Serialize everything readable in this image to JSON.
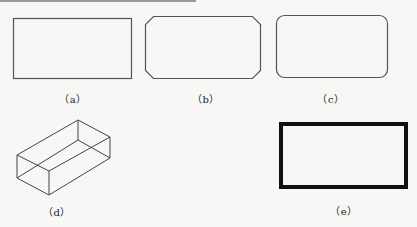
{
  "figure": {
    "panels": [
      {
        "id": "a",
        "label": "（a）",
        "shape": "rectangle",
        "description": "plain rectangle, thin border"
      },
      {
        "id": "b",
        "label": "（b）",
        "shape": "chamfered-rectangle",
        "description": "rectangle with chamfered (beveled) corners"
      },
      {
        "id": "c",
        "label": "（c）",
        "shape": "rounded-rectangle",
        "description": "rectangle with filleted (rounded) corners"
      },
      {
        "id": "d",
        "label": "（d）",
        "shape": "3d-box",
        "description": "isometric wireframe box (3D rectangle)"
      },
      {
        "id": "e",
        "label": "（e）",
        "shape": "thick-rectangle",
        "description": "rectangle with wide border line"
      }
    ],
    "colors": {
      "stroke": "#555555",
      "thick_stroke": "#111111",
      "background": "#f7f7f5",
      "top_rule": "#9a9a9a"
    }
  }
}
